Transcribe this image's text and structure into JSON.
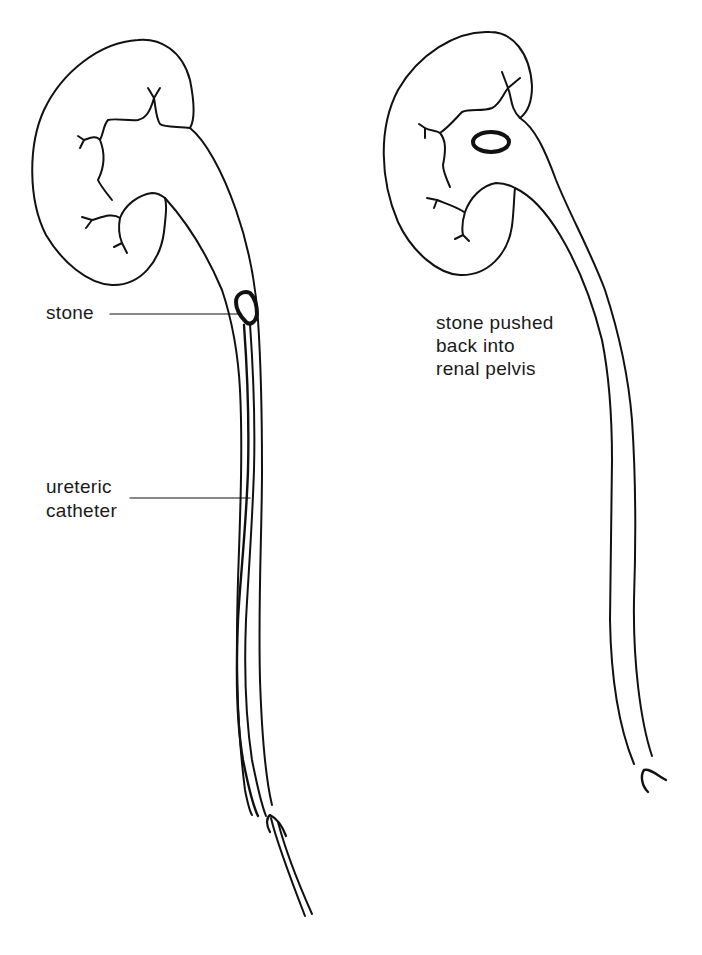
{
  "figure": {
    "colors": {
      "ink": "#111111",
      "background": "#ffffff"
    },
    "left_panel": {
      "labels": {
        "stone": "stone",
        "catheter_line1": "ureteric",
        "catheter_line2": "catheter"
      }
    },
    "right_panel": {
      "labels": {
        "line1": "stone pushed",
        "line2": "back into",
        "line3": "renal pelvis"
      }
    }
  }
}
